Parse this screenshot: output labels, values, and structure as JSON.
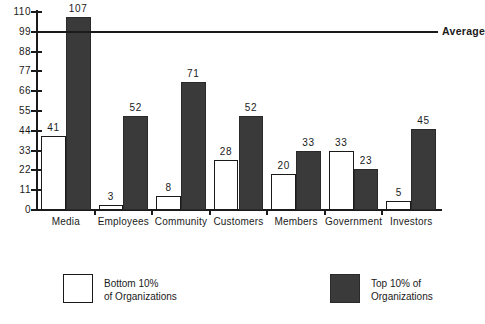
{
  "chart_data": {
    "type": "bar",
    "title": "",
    "xlabel": "",
    "ylabel": "",
    "ylim": [
      0,
      110
    ],
    "yticks": [
      0,
      11,
      22,
      33,
      44,
      55,
      66,
      77,
      88,
      99,
      110
    ],
    "grid": false,
    "legend_position": "bottom",
    "categories": [
      "Media",
      "Employees",
      "Community",
      "Customers",
      "Members",
      "Government",
      "Investors"
    ],
    "series": [
      {
        "name": "Bottom 10% of Organizations",
        "values": [
          41,
          3,
          8,
          28,
          20,
          33,
          5
        ],
        "style": "white-outline"
      },
      {
        "name": "Top 10% of Organizations",
        "values": [
          107,
          52,
          71,
          52,
          33,
          23,
          45
        ],
        "style": "dark-fill"
      }
    ],
    "annotations": [
      {
        "name": "average-line",
        "label": "Average",
        "value": 99,
        "orientation": "horizontal"
      }
    ]
  },
  "axis": {
    "y_tick_labels": [
      "110",
      "99",
      "88",
      "77",
      "66",
      "55",
      "44",
      "33",
      "22",
      "11",
      "0"
    ]
  },
  "categories": [
    {
      "label": "Media",
      "bottom": "41",
      "top": "107"
    },
    {
      "label": "Employees",
      "bottom": "3",
      "top": "52"
    },
    {
      "label": "Community",
      "bottom": "8",
      "top": "71"
    },
    {
      "label": "Customers",
      "bottom": "28",
      "top": "52"
    },
    {
      "label": "Members",
      "bottom": "20",
      "top": "33"
    },
    {
      "label": "Government",
      "bottom": "33",
      "top": "23"
    },
    {
      "label": "Investors",
      "bottom": "5",
      "top": "45"
    }
  ],
  "average": {
    "label": "Average",
    "value": "99"
  },
  "legend": {
    "bottom": {
      "line1": "Bottom  10%",
      "line2": "of  Organizations"
    },
    "top": {
      "line1": "Top 10% of",
      "line2": "Organizations"
    }
  },
  "colors": {
    "ink": "#1a1a1a",
    "dark_fill": "#3a3a3a",
    "light_fill": "#ffffff",
    "background": "#ffffff"
  }
}
